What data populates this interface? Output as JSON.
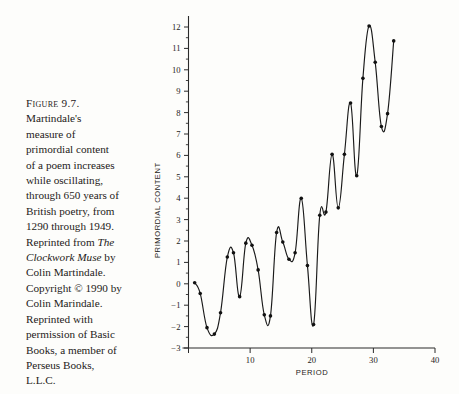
{
  "figure": {
    "caption_lines": [
      {
        "text": "Figure 9.7.",
        "style": "smallcaps"
      },
      {
        "text": "Martindale's",
        "style": "normal"
      },
      {
        "text": "measure of",
        "style": "normal"
      },
      {
        "text": "primordial content",
        "style": "normal"
      },
      {
        "text": "of a poem increases",
        "style": "normal"
      },
      {
        "text": "while oscillating,",
        "style": "normal"
      },
      {
        "text": "through 650 years of",
        "style": "normal"
      },
      {
        "text": "British poetry, from",
        "style": "normal"
      },
      {
        "text": "1290 through 1949.",
        "style": "normal"
      },
      {
        "text": "Reprinted from ",
        "style": "normal",
        "tail_italic": "The"
      },
      {
        "text": "Clockwork Muse",
        "style": "italic",
        "tail_normal": " by"
      },
      {
        "text": "Colin Martindale.",
        "style": "normal"
      },
      {
        "text": "Copyright © 1990 by",
        "style": "normal"
      },
      {
        "text": "Colin Marindale.",
        "style": "normal"
      },
      {
        "text": "Reprinted with",
        "style": "normal"
      },
      {
        "text": "permission of Basic",
        "style": "normal"
      },
      {
        "text": "Books, a member of",
        "style": "normal"
      },
      {
        "text": "Perseus Books,",
        "style": "normal"
      },
      {
        "text": "L.L.C.",
        "style": "normal"
      }
    ]
  },
  "chart_data": {
    "type": "line",
    "title": "",
    "subtitle": "",
    "xlabel": "PERIOD",
    "ylabel": "PRIMORDIAL CONTENT",
    "xlim": [
      0,
      40
    ],
    "ylim": [
      -3,
      12
    ],
    "xticks": [
      0,
      10,
      20,
      30,
      40
    ],
    "xticklabels": [
      "",
      "10",
      "20",
      "30",
      "40"
    ],
    "yticks": [
      -3,
      -2,
      -1,
      0,
      1,
      2,
      3,
      4,
      5,
      6,
      7,
      8,
      9,
      10,
      11,
      12
    ],
    "yticklabels": [
      "−3",
      "−2",
      "−1",
      "0",
      "1",
      "2",
      "3",
      "4",
      "5",
      "6",
      "7",
      "8",
      "9",
      "10",
      "11",
      "12"
    ],
    "grid": false,
    "legend": null,
    "marker": "filled-circle",
    "line_color": "#1a1a1a",
    "series": [
      {
        "name": "Primordial content",
        "x": [
          1.0,
          1.9,
          3.0,
          4.2,
          5.2,
          6.3,
          7.3,
          8.3,
          9.3,
          10.3,
          11.3,
          12.3,
          13.3,
          14.3,
          15.3,
          16.3,
          17.3,
          18.3,
          19.3,
          20.3,
          21.3,
          22.3,
          23.3,
          24.3,
          25.3,
          26.3,
          27.3,
          28.3,
          29.3,
          30.3,
          31.3,
          32.3,
          33.3
        ],
        "y": [
          0.05,
          -0.45,
          -2.05,
          -2.35,
          -1.35,
          1.25,
          1.45,
          -0.6,
          1.9,
          1.8,
          0.65,
          -1.45,
          -1.5,
          2.4,
          1.95,
          1.15,
          1.45,
          4.0,
          0.85,
          -1.9,
          3.2,
          3.35,
          6.05,
          3.55,
          6.05,
          8.45,
          5.05,
          9.6,
          12.05,
          10.35,
          7.35,
          7.95,
          11.35
        ]
      }
    ]
  }
}
